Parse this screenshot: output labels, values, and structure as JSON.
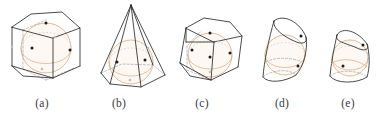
{
  "figure": {
    "background_color": "#ffffff",
    "edge_color": "#2b2b2b",
    "hidden_edge_color": "#9aa0a6",
    "sphere_color": "#d9a97e",
    "sphere_fill_color": "#fbf3ea",
    "tangent_point_color": "#1c1c1c",
    "caption_color": "#3a3a3a",
    "panels": [
      {
        "id": "a",
        "caption": "(a)",
        "shape": "pentagonal prism",
        "inscribed": "sphere",
        "tangent_points_visible": 4,
        "caption_x": 42
      },
      {
        "id": "b",
        "caption": "(b)",
        "shape": "hexagonal pyramid",
        "inscribed": "sphere",
        "tangent_points_visible": 4,
        "caption_x": 119
      },
      {
        "id": "c",
        "caption": "(c)",
        "shape": "tilted pentagonal prism",
        "inscribed": "sphere",
        "tangent_points_visible": 5,
        "caption_x": 202
      },
      {
        "id": "d",
        "caption": "(d)",
        "shape": "oblique cone",
        "inscribed": "sphere",
        "tangent_points_visible": 2,
        "caption_x": 282
      },
      {
        "id": "e",
        "caption": "(e)",
        "shape": "oblique conical frustum",
        "inscribed": "sphere",
        "tangent_points_visible": 2,
        "caption_x": 348
      }
    ]
  }
}
